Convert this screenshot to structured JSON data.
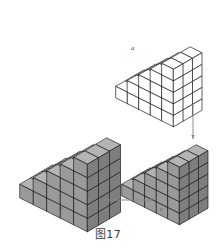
{
  "figure": {
    "caption": "图17",
    "background_color": "#ffffff",
    "line_color": "#1c1c1c",
    "shaded_face_colors": {
      "top": "#b4b4b4",
      "front": "#9a9a9a",
      "side": "#7e7e7e"
    },
    "white_face_color": "#ffffff",
    "arrow_color": "#8c8c8c"
  },
  "labels": {
    "a": "a",
    "b": "b",
    "c": "c"
  },
  "solids": [
    {
      "id": "top-white-staircase",
      "name": "white-staircase-solid",
      "label": "a",
      "shaded": false,
      "steps": 5,
      "depth": 3,
      "description": "unshaded staircase block solid, upper right"
    },
    {
      "id": "left-shaded-staircase",
      "name": "shaded-staircase-solid",
      "label": "b",
      "shaded": true,
      "steps": 5,
      "depth": 3,
      "description": "gray shaded staircase block solid, lower left"
    },
    {
      "id": "right-shaded-columns",
      "name": "shaded-column-staircase-solid",
      "label": "c",
      "shaded": true,
      "steps": 5,
      "depth": 3,
      "description": "gray shaded solid of stepped vertical columns, lower right"
    }
  ],
  "arrows": [
    {
      "id": "arrow-horizontal",
      "name": "arrow-right",
      "direction": "right",
      "from": "left-shaded-staircase",
      "to": "right-shaded-columns"
    },
    {
      "id": "arrow-vertical",
      "name": "arrow-down",
      "direction": "down",
      "from": "top-white-staircase",
      "to": "right-shaded-columns"
    }
  ]
}
